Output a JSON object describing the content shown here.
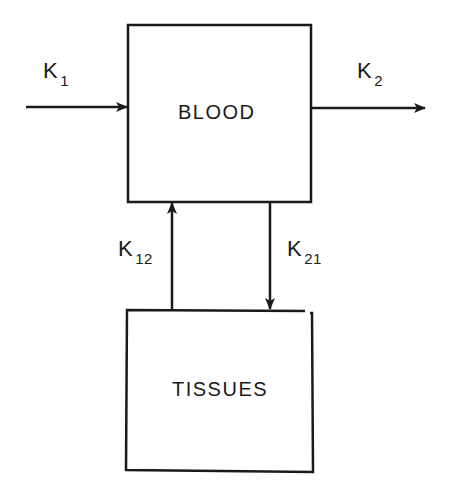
{
  "diagram": {
    "type": "compartment-model",
    "compartments": [
      {
        "id": "blood",
        "label": "BLOOD"
      },
      {
        "id": "tissues",
        "label": "TISSUES"
      }
    ],
    "flows": [
      {
        "id": "k1",
        "symbol": "K",
        "subscript": "1",
        "from": "external",
        "to": "blood"
      },
      {
        "id": "k2",
        "symbol": "K",
        "subscript": "2",
        "from": "blood",
        "to": "external"
      },
      {
        "id": "k12",
        "symbol": "K",
        "subscript": "12",
        "from": "tissues",
        "to": "blood"
      },
      {
        "id": "k21",
        "symbol": "K",
        "subscript": "21",
        "from": "blood",
        "to": "tissues"
      }
    ]
  },
  "colors": {
    "stroke": "#1a1a1a",
    "background": "#ffffff"
  }
}
